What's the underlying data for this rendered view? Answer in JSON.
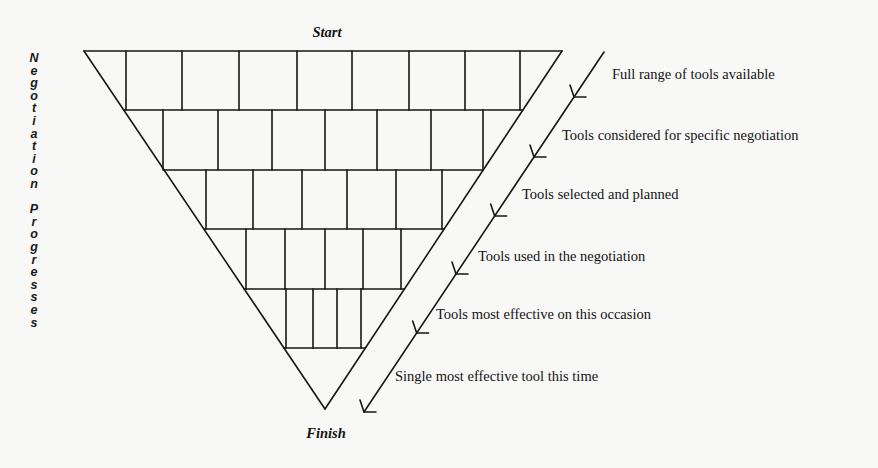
{
  "start_label": "Start",
  "finish_label": "Finish",
  "side_label": {
    "text": "Negotiation Progresses",
    "letters": [
      "N",
      "e",
      "g",
      "o",
      "t",
      "i",
      "a",
      "t",
      "i",
      "o",
      "n",
      "",
      "P",
      "r",
      "o",
      "g",
      "r",
      "e",
      "s",
      "s",
      "e",
      "s"
    ]
  },
  "stages": [
    {
      "label": "Full range of tools available",
      "cells": 9
    },
    {
      "label": "Tools considered for specific negotiation",
      "cells": 8
    },
    {
      "label": "Tools selected and planned",
      "cells": 7
    },
    {
      "label": "Tools used in the negotiation",
      "cells": 6
    },
    {
      "label": "Tools most effective on this occasion",
      "cells": 5
    },
    {
      "label": "Single most effective tool this time",
      "cells": 1
    }
  ],
  "colors": {
    "line": "#161616",
    "text": "#141414",
    "background": "#f8f8f6"
  }
}
